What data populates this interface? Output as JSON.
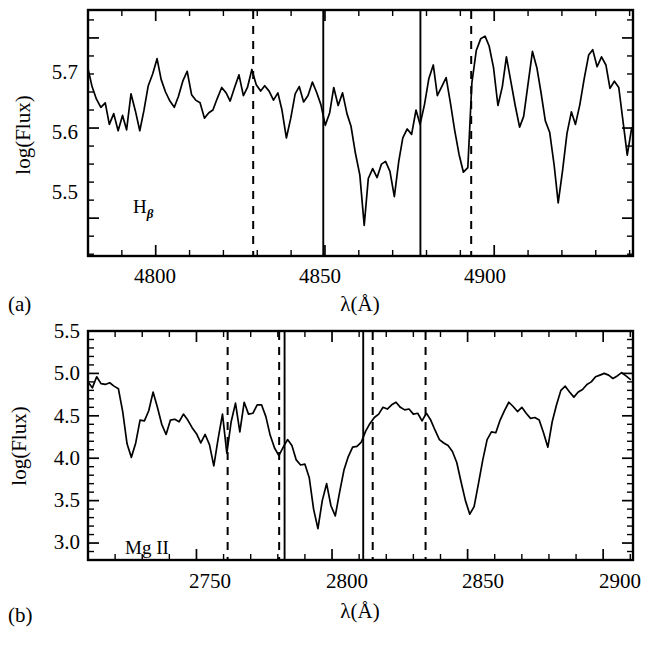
{
  "figure": {
    "title": "",
    "panels": [
      {
        "id": "a",
        "panel_label": "(a)",
        "annotation_main": "H",
        "annotation_sub": "β",
        "xlabel": "λ(Å)",
        "ylabel": "log(Flux)",
        "xticklabels": [
          "4800",
          "4850",
          "4900"
        ],
        "yticklabels": [
          "5.7",
          "5.6",
          "5.5"
        ]
      },
      {
        "id": "b",
        "panel_label": "(b)",
        "annotation_main": "Mg II",
        "annotation_sub": "",
        "xlabel": "λ(Å)",
        "ylabel": "log(Flux)",
        "xticklabels": [
          "2750",
          "2800",
          "2850",
          "2900"
        ],
        "yticklabels": [
          "5.5",
          "5.0",
          "4.5",
          "4.0",
          "3.5",
          "3.0"
        ]
      }
    ]
  },
  "chart_data": [
    {
      "type": "line",
      "panel": "a",
      "title": "",
      "xlabel": "λ(Å)",
      "ylabel": "log(Flux)",
      "xlim": [
        4780,
        4941
      ],
      "ylim": [
        5.458,
        5.731
      ],
      "xticks": [
        4800,
        4850,
        4900
      ],
      "yticks": [
        5.5,
        5.6,
        5.7
      ],
      "xminor_step": 10,
      "yminor_step": 0.02,
      "grid": false,
      "legend": null,
      "annotations": [
        {
          "text": "Hβ",
          "x": 4800,
          "y": 5.487
        }
      ],
      "vlines": [
        {
          "x": 4828.8,
          "style": "dashed"
        },
        {
          "x": 4849.5,
          "style": "solid"
        },
        {
          "x": 4878.2,
          "style": "solid"
        },
        {
          "x": 4893.2,
          "style": "dashed"
        }
      ],
      "x": [
        4780.0,
        4781.2,
        4782.5,
        4783.8,
        4785.1,
        4786.3,
        4787.6,
        4788.9,
        4790.2,
        4791.4,
        4792.7,
        4794.0,
        4795.3,
        4796.5,
        4797.8,
        4799.1,
        4800.4,
        4801.6,
        4802.9,
        4804.2,
        4805.5,
        4806.7,
        4808.0,
        4809.3,
        4810.6,
        4811.8,
        4813.1,
        4814.4,
        4815.7,
        4816.9,
        4818.2,
        4819.5,
        4820.8,
        4822.0,
        4823.3,
        4824.6,
        4825.9,
        4827.1,
        4828.4,
        4829.7,
        4831.0,
        4832.2,
        4833.5,
        4834.8,
        4836.1,
        4837.3,
        4838.6,
        4839.9,
        4841.2,
        4842.4,
        4843.7,
        4845.0,
        4846.3,
        4847.5,
        4848.8,
        4850.1,
        4851.4,
        4852.6,
        4853.9,
        4855.2,
        4856.5,
        4857.7,
        4859.0,
        4860.3,
        4861.6,
        4862.8,
        4864.1,
        4865.4,
        4866.7,
        4867.9,
        4869.2,
        4870.5,
        4871.8,
        4873.0,
        4874.3,
        4875.6,
        4876.9,
        4878.1,
        4879.4,
        4880.7,
        4882.0,
        4883.2,
        4884.5,
        4885.8,
        4887.1,
        4888.3,
        4889.6,
        4890.9,
        4892.2,
        4893.4,
        4894.7,
        4896.0,
        4897.3,
        4898.5,
        4899.8,
        4901.1,
        4902.4,
        4903.6,
        4904.9,
        4906.2,
        4907.5,
        4908.7,
        4910.0,
        4911.3,
        4912.6,
        4913.8,
        4915.1,
        4916.4,
        4917.7,
        4918.9,
        4920.2,
        4921.5,
        4922.8,
        4924.0,
        4925.3,
        4926.6,
        4927.9,
        4929.1,
        4930.4,
        4931.7,
        4933.0,
        4934.2,
        4935.5,
        4936.8,
        4938.1,
        4939.3,
        4940.6
      ],
      "y": [
        5.666,
        5.646,
        5.632,
        5.623,
        5.628,
        5.604,
        5.616,
        5.597,
        5.614,
        5.598,
        5.638,
        5.619,
        5.597,
        5.619,
        5.647,
        5.66,
        5.677,
        5.654,
        5.64,
        5.63,
        5.623,
        5.635,
        5.652,
        5.663,
        5.637,
        5.631,
        5.628,
        5.611,
        5.617,
        5.62,
        5.633,
        5.645,
        5.639,
        5.63,
        5.645,
        5.659,
        5.636,
        5.645,
        5.665,
        5.648,
        5.641,
        5.647,
        5.641,
        5.631,
        5.639,
        5.62,
        5.589,
        5.611,
        5.638,
        5.646,
        5.629,
        5.636,
        5.651,
        5.64,
        5.626,
        5.603,
        5.617,
        5.645,
        5.625,
        5.639,
        5.616,
        5.602,
        5.572,
        5.548,
        5.492,
        5.544,
        5.555,
        5.545,
        5.56,
        5.563,
        5.552,
        5.524,
        5.563,
        5.589,
        5.599,
        5.593,
        5.62,
        5.604,
        5.626,
        5.655,
        5.67,
        5.636,
        5.646,
        5.656,
        5.627,
        5.598,
        5.571,
        5.551,
        5.556,
        5.65,
        5.686,
        5.699,
        5.702,
        5.691,
        5.667,
        5.625,
        5.646,
        5.679,
        5.652,
        5.625,
        5.601,
        5.613,
        5.649,
        5.685,
        5.667,
        5.64,
        5.608,
        5.595,
        5.559,
        5.517,
        5.553,
        5.594,
        5.618,
        5.604,
        5.626,
        5.655,
        5.681,
        5.687,
        5.668,
        5.679,
        5.67,
        5.644,
        5.652,
        5.645,
        5.606,
        5.57,
        5.6
      ]
    },
    {
      "type": "line",
      "panel": "b",
      "title": "",
      "xlabel": "λ(Å)",
      "ylabel": "log(Flux)",
      "xlim": [
        2710,
        2911
      ],
      "ylim": [
        2.8,
        5.5
      ],
      "xticks": [
        2750,
        2800,
        2850,
        2900
      ],
      "yticks": [
        3.0,
        3.5,
        4.0,
        4.5,
        5.0,
        5.5
      ],
      "xminor_step": 10,
      "yminor_step": 0.1,
      "grid": false,
      "legend": null,
      "annotations": [
        {
          "text": "Mg II",
          "x": 2740,
          "y": 3.05
        }
      ],
      "vlines": [
        {
          "x": 2761.5,
          "style": "dashed"
        },
        {
          "x": 2780.5,
          "style": "dashed"
        },
        {
          "x": 2782.5,
          "style": "solid"
        },
        {
          "x": 2811.5,
          "style": "solid"
        },
        {
          "x": 2815.0,
          "style": "dashed"
        },
        {
          "x": 2834.5,
          "style": "dashed"
        }
      ],
      "x": [
        2710.0,
        2711.6,
        2713.2,
        2714.8,
        2716.4,
        2718.0,
        2719.6,
        2721.2,
        2722.8,
        2724.4,
        2726.0,
        2727.6,
        2729.2,
        2730.8,
        2732.4,
        2734.0,
        2735.6,
        2737.2,
        2738.8,
        2740.4,
        2742.0,
        2743.6,
        2745.2,
        2746.8,
        2748.4,
        2750.0,
        2751.6,
        2753.2,
        2754.8,
        2756.4,
        2758.0,
        2759.6,
        2761.2,
        2762.8,
        2764.4,
        2766.0,
        2767.6,
        2769.2,
        2770.8,
        2772.4,
        2774.0,
        2775.6,
        2777.2,
        2778.8,
        2780.4,
        2782.0,
        2783.6,
        2785.2,
        2786.8,
        2788.4,
        2790.0,
        2791.6,
        2793.2,
        2794.8,
        2796.4,
        2798.0,
        2799.6,
        2801.2,
        2802.8,
        2804.4,
        2806.0,
        2807.6,
        2809.2,
        2810.8,
        2812.4,
        2814.0,
        2815.6,
        2817.2,
        2818.8,
        2820.4,
        2822.0,
        2823.6,
        2825.2,
        2826.8,
        2828.4,
        2830.0,
        2831.6,
        2833.2,
        2834.8,
        2836.4,
        2838.0,
        2839.6,
        2841.2,
        2842.8,
        2844.4,
        2846.0,
        2847.6,
        2849.2,
        2850.8,
        2852.4,
        2854.0,
        2855.6,
        2857.2,
        2858.8,
        2860.4,
        2862.0,
        2863.6,
        2865.2,
        2866.8,
        2868.4,
        2870.0,
        2871.6,
        2873.2,
        2874.8,
        2876.4,
        2878.0,
        2879.6,
        2881.2,
        2882.8,
        2884.4,
        2886.0,
        2887.6,
        2889.2,
        2890.8,
        2892.4,
        2894.0,
        2895.6,
        2897.2,
        2898.8,
        2900.4,
        2902.0,
        2903.6,
        2905.2,
        2906.8,
        2908.4,
        2910.0
      ],
      "y": [
        4.9,
        4.83,
        4.96,
        4.88,
        4.87,
        4.89,
        4.85,
        4.82,
        4.55,
        4.17,
        4.01,
        4.18,
        4.45,
        4.44,
        4.56,
        4.78,
        4.6,
        4.4,
        4.28,
        4.45,
        4.46,
        4.43,
        4.52,
        4.45,
        4.36,
        4.29,
        4.18,
        4.28,
        4.16,
        3.91,
        4.23,
        4.52,
        4.06,
        4.43,
        4.65,
        4.31,
        4.66,
        4.52,
        4.53,
        4.63,
        4.63,
        4.49,
        4.27,
        4.12,
        4.03,
        4.13,
        4.22,
        4.15,
        3.98,
        3.92,
        3.93,
        3.77,
        3.4,
        3.17,
        3.5,
        3.7,
        3.44,
        3.32,
        3.6,
        3.86,
        4.02,
        4.13,
        4.14,
        4.19,
        4.32,
        4.41,
        4.48,
        4.52,
        4.6,
        4.58,
        4.63,
        4.66,
        4.6,
        4.57,
        4.58,
        4.52,
        4.53,
        4.44,
        4.53,
        4.45,
        4.33,
        4.22,
        4.18,
        4.15,
        4.08,
        3.95,
        3.72,
        3.5,
        3.34,
        3.43,
        3.7,
        3.98,
        4.22,
        4.31,
        4.3,
        4.45,
        4.56,
        4.66,
        4.61,
        4.55,
        4.6,
        4.53,
        4.47,
        4.48,
        4.45,
        4.3,
        4.13,
        4.43,
        4.63,
        4.8,
        4.85,
        4.78,
        4.72,
        4.78,
        4.81,
        4.87,
        4.9,
        4.96,
        4.98,
        5.0,
        4.98,
        4.94,
        4.97,
        5.01,
        4.97,
        4.93
      ]
    }
  ]
}
